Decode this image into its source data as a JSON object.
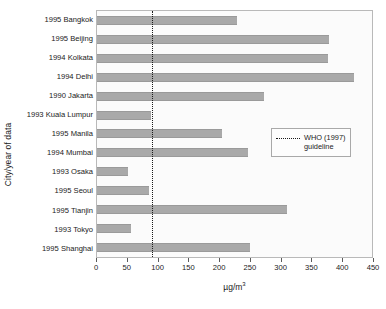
{
  "chart_data": {
    "type": "bar",
    "orientation": "horizontal",
    "title": "",
    "xlabel": "µg/m³",
    "ylabel": "City/year of data",
    "xlim": [
      0,
      450
    ],
    "xticks": [
      0,
      50,
      100,
      150,
      200,
      250,
      300,
      350,
      400,
      450
    ],
    "xtick_labels": [
      "0",
      "50",
      "100",
      "150",
      "200",
      "250",
      "300",
      "350",
      "400",
      "450"
    ],
    "grid": false,
    "legend_position": "center-right",
    "categories": [
      "1995 Bangkok",
      "1995 Beijing",
      "1994 Kolkata",
      "1994 Delhi",
      "1990 Jakarta",
      "1993 Kuala Lumpur",
      "1995 Manila",
      "1994 Mumbai",
      "1993 Osaka",
      "1995 Seoul",
      "1995 Tianjin",
      "1993 Tokyo",
      "1995 Shanghai"
    ],
    "values": [
      227,
      377,
      375,
      417,
      271,
      88,
      203,
      245,
      50,
      84,
      308,
      55,
      248
    ],
    "series_name": "Particulate matter concentration",
    "annotations": [
      {
        "name": "who-guideline",
        "type": "vertical-line",
        "value": 90,
        "style": "dotted",
        "label": "WHO (1997)\nguideline"
      }
    ],
    "legend": [
      {
        "label": "WHO (1997)\nguideline",
        "marker": "dotted-line"
      }
    ],
    "colors": {
      "bar_fill": "#a9a9a9",
      "bar_edge": "#9a9a9a",
      "plot_background": "#fbfbfb",
      "axis": "#b9b9b9",
      "guideline": "#1a1a1a",
      "text": "#1a1a1a"
    }
  }
}
